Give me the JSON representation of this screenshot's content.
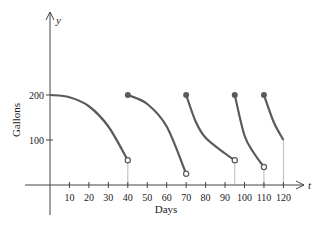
{
  "chart_data": {
    "type": "line",
    "title": "",
    "xlabel": "Days",
    "ylabel": "Gallons",
    "x_axis_symbol": "t",
    "y_axis_symbol": "y",
    "xlim": [
      0,
      120
    ],
    "ylim": [
      0,
      200
    ],
    "x_ticks": [
      10,
      20,
      30,
      40,
      50,
      60,
      70,
      80,
      90,
      100,
      110,
      120
    ],
    "y_ticks": [
      100,
      200
    ],
    "grid": false,
    "legend": null,
    "series": [
      {
        "name": "segment-1",
        "x": [
          0,
          10,
          20,
          30,
          40
        ],
        "values": [
          200,
          195,
          175,
          130,
          55
        ],
        "start_marker": "none",
        "end_marker": "open"
      },
      {
        "name": "segment-2",
        "x": [
          40,
          50,
          60,
          70
        ],
        "values": [
          200,
          180,
          130,
          25
        ],
        "start_marker": "filled",
        "end_marker": "open"
      },
      {
        "name": "segment-3",
        "x": [
          70,
          75,
          80,
          90,
          95
        ],
        "values": [
          200,
          140,
          105,
          70,
          55
        ],
        "start_marker": "filled",
        "end_marker": "open"
      },
      {
        "name": "segment-4",
        "x": [
          95,
          100,
          105,
          110
        ],
        "values": [
          200,
          110,
          70,
          40
        ],
        "start_marker": "filled",
        "end_marker": "open"
      },
      {
        "name": "segment-5",
        "x": [
          110,
          115,
          120
        ],
        "values": [
          200,
          140,
          100
        ],
        "start_marker": "filled",
        "end_marker": "none"
      }
    ],
    "vertical_guides_at": [
      40,
      95,
      110,
      120
    ],
    "colors": {
      "curve": "#5a5a5a",
      "axis": "#444444",
      "guide": "#bbbbbb",
      "text": "#222222"
    }
  }
}
